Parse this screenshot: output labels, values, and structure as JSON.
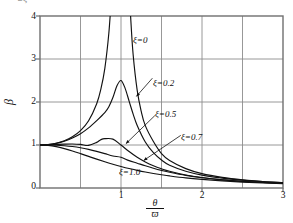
{
  "figure": {
    "top_fragment": "2ξ",
    "background": "#ffffff",
    "line_color": "#111111",
    "grid_color": "#8c8c8c",
    "frame_color": "#6f6f6f"
  },
  "chart_data": {
    "type": "line",
    "title": "",
    "subtitle": "",
    "xlabel": "θ/ϖ",
    "xlabel_numerator": "θ",
    "xlabel_denominator": "ϖ",
    "ylabel": "β",
    "xlim": [
      0,
      3
    ],
    "ylim": [
      0,
      4
    ],
    "xticks": [
      0,
      1,
      2,
      3
    ],
    "xtick_labels": [
      "",
      "1",
      "2",
      "3"
    ],
    "yticks": [
      0,
      1,
      2,
      3,
      4
    ],
    "ytick_labels": [
      "0",
      "1",
      "2",
      "3",
      "4"
    ],
    "grid": true,
    "grid_x_step": 0.5,
    "grid_y_step": 1,
    "legend": "inline-annotations",
    "legend_position": "inline",
    "equation": "β = 1 / sqrt((1 - r^2)^2 + (2ξr)^2)",
    "annotations": [
      {
        "text": "ξ=0",
        "x": 1.15,
        "y": 3.55,
        "leader": false
      },
      {
        "text": "ξ=0.2",
        "x": 1.4,
        "y": 2.6,
        "leader": true,
        "leader_to_x": 1.19,
        "leader_to_y": 2.13
      },
      {
        "text": "ξ=0.5",
        "x": 1.43,
        "y": 1.73,
        "leader": true,
        "leader_to_x": 1.06,
        "leader_to_y": 1.03
      },
      {
        "text": "ξ=0.7",
        "x": 1.75,
        "y": 1.27,
        "leader": true,
        "leader_to_x": 1.28,
        "leader_to_y": 0.64
      },
      {
        "text": "ξ=1.0",
        "x": 0.98,
        "y": 0.33,
        "leader": false
      }
    ],
    "series": [
      {
        "name": "ξ=0",
        "damping_ratio": 0,
        "x": [
          0,
          0.1,
          0.2,
          0.3,
          0.4,
          0.5,
          0.6,
          0.7,
          0.75,
          0.8,
          0.85,
          0.88,
          0.9,
          0.92,
          0.94,
          0.96,
          1.04,
          1.06,
          1.08,
          1.1,
          1.12,
          1.15,
          1.2,
          1.25,
          1.3,
          1.4,
          1.5,
          1.6,
          1.8,
          2.0,
          2.25,
          2.5,
          2.75,
          3.0
        ],
        "y": [
          1.0,
          1.01,
          1.042,
          1.099,
          1.19,
          1.333,
          1.563,
          1.961,
          2.286,
          2.778,
          3.604,
          4.413,
          5.263,
          6.527,
          8.613,
          12.76,
          12.25,
          8.09,
          6.06,
          4.76,
          3.95,
          3.1,
          2.27,
          1.78,
          1.45,
          1.08,
          0.8,
          0.64,
          0.45,
          0.333,
          0.246,
          0.19,
          0.152,
          0.125
        ]
      },
      {
        "name": "ξ=0.2",
        "damping_ratio": 0.2,
        "x": [
          0,
          0.1,
          0.2,
          0.3,
          0.4,
          0.5,
          0.6,
          0.7,
          0.8,
          0.85,
          0.9,
          0.95,
          1.0,
          1.05,
          1.1,
          1.15,
          1.2,
          1.3,
          1.4,
          1.5,
          1.6,
          1.8,
          2.0,
          2.25,
          2.5,
          2.75,
          3.0
        ],
        "y": [
          1.0,
          1.009,
          1.038,
          1.087,
          1.161,
          1.262,
          1.398,
          1.567,
          1.754,
          1.889,
          2.103,
          2.377,
          2.5,
          2.323,
          2.02,
          1.719,
          1.455,
          1.07,
          0.82,
          0.65,
          0.53,
          0.39,
          0.3,
          0.23,
          0.183,
          0.148,
          0.123
        ]
      },
      {
        "name": "ξ=0.5",
        "damping_ratio": 0.5,
        "x": [
          0,
          0.1,
          0.2,
          0.3,
          0.4,
          0.5,
          0.6,
          0.7,
          0.75,
          0.8,
          0.9,
          1.0,
          1.1,
          1.2,
          1.3,
          1.4,
          1.5,
          1.6,
          1.8,
          2.0,
          2.25,
          2.5,
          2.75,
          3.0
        ],
        "y": [
          1.0,
          1.003,
          1.011,
          1.019,
          1.022,
          1.013,
          0.99,
          1.061,
          1.123,
          1.148,
          1.137,
          1.0,
          0.848,
          0.714,
          0.605,
          0.517,
          0.447,
          0.389,
          0.302,
          0.243,
          0.19,
          0.154,
          0.128,
          0.108
        ]
      },
      {
        "name": "ξ=0.7",
        "damping_ratio": 0.7,
        "x": [
          0,
          0.1,
          0.2,
          0.3,
          0.4,
          0.5,
          0.6,
          0.7,
          0.8,
          0.9,
          1.0,
          1.1,
          1.2,
          1.3,
          1.4,
          1.5,
          1.6,
          1.8,
          2.0,
          2.25,
          2.5,
          2.75,
          3.0
        ],
        "y": [
          1.0,
          0.999,
          0.994,
          0.983,
          0.964,
          0.936,
          0.898,
          0.852,
          0.8,
          0.745,
          0.714,
          0.637,
          0.577,
          0.516,
          0.46,
          0.41,
          0.366,
          0.293,
          0.239,
          0.19,
          0.155,
          0.129,
          0.109
        ]
      },
      {
        "name": "ξ=1.0",
        "damping_ratio": 1.0,
        "x": [
          0,
          0.1,
          0.2,
          0.3,
          0.4,
          0.5,
          0.6,
          0.7,
          0.8,
          0.9,
          1.0,
          1.1,
          1.2,
          1.3,
          1.4,
          1.5,
          1.6,
          1.8,
          2.0,
          2.25,
          2.5,
          2.75,
          3.0
        ],
        "y": [
          1.0,
          0.99,
          0.962,
          0.917,
          0.862,
          0.8,
          0.735,
          0.671,
          0.61,
          0.553,
          0.5,
          0.452,
          0.41,
          0.372,
          0.338,
          0.308,
          0.281,
          0.235,
          0.2,
          0.165,
          0.138,
          0.117,
          0.1
        ]
      }
    ]
  }
}
